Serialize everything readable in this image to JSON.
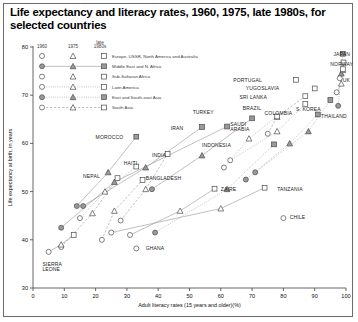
{
  "title": "Life expectancy and literacy rates, 1960, 1975, late 1980s, for selected countries",
  "legend": {
    "headers": [
      "1960",
      "1975",
      "late 1980s"
    ],
    "series": [
      {
        "label": "Europe, USSR, North America and Australia",
        "line": "none",
        "fill": "hollow"
      },
      {
        "label": "Middle East and N. Africa",
        "line": "solid",
        "fill": "filled"
      },
      {
        "label": "Sub-Saharan Africa",
        "line": "none",
        "fill": "hollow"
      },
      {
        "label": "Latin America",
        "line": "dotted",
        "fill": "hollow"
      },
      {
        "label": "East and South-east Asia",
        "line": "dotted",
        "fill": "filled"
      },
      {
        "label": "South Asia",
        "line": "dashed",
        "fill": "hollow"
      }
    ],
    "markers": {
      "1960": "circle",
      "1975": "triangle",
      "late1980s": "square"
    }
  },
  "chart_data": {
    "type": "scatter",
    "title": "Life expectancy and literacy rates, 1960, 1975, late 1980s, for selected countries",
    "xlabel": "Adult literacy rates (15 years and older)(%)",
    "ylabel": "Life expectancy at birth, in years",
    "xlim": [
      0,
      100
    ],
    "ylim": [
      30,
      80
    ],
    "xticks": [
      0,
      10,
      20,
      30,
      40,
      50,
      60,
      70,
      80,
      90,
      100
    ],
    "yticks": [
      30,
      40,
      50,
      60,
      70,
      80
    ],
    "grid": false,
    "legend_position": "top-left-inside",
    "point_years": [
      "1960",
      "1975",
      "late 1980s"
    ],
    "countries": [
      {
        "name": "JAPAN",
        "region": "East and South-east Asia",
        "label_x": 96,
        "label_y": 78.6,
        "points": [
          {
            "year": "1960",
            "x": 97.5,
            "y": 67.8
          },
          {
            "year": "1975",
            "x": 98.5,
            "y": 74.5
          },
          {
            "year": "late 1980s",
            "x": 99.0,
            "y": 78.6
          }
        ]
      },
      {
        "name": "NORWAY",
        "region": "Europe, USSR, North America and Australia",
        "label_x": 95,
        "label_y": 76.4,
        "points": [
          {
            "year": "1960",
            "x": 98.0,
            "y": 73.5
          },
          {
            "year": "1975",
            "x": 99.0,
            "y": 75.2
          },
          {
            "year": "late 1980s",
            "x": 99.2,
            "y": 76.8
          }
        ]
      },
      {
        "name": "UK",
        "region": "Europe, USSR, North America and Australia",
        "label_x": 99,
        "label_y": 73.2,
        "points": [
          {
            "year": "1960",
            "x": 97.0,
            "y": 70.6
          },
          {
            "year": "1975",
            "x": 98.5,
            "y": 72.4
          },
          {
            "year": "late 1980s",
            "x": 99.0,
            "y": 75.4
          }
        ]
      },
      {
        "name": "PORTUGAL",
        "region": "Europe, USSR, North America and Australia",
        "label_x": 64,
        "label_y": 73.2,
        "points": [
          {
            "year": "late 1980s",
            "x": 84.0,
            "y": 73.2
          }
        ]
      },
      {
        "name": "YUGOSLAVIA",
        "region": "Europe, USSR, North America and Australia",
        "label_x": 68,
        "label_y": 71.4,
        "points": [
          {
            "year": "late 1980s",
            "x": 90.0,
            "y": 71.4
          }
        ]
      },
      {
        "name": "SRI LANKA",
        "region": "South Asia",
        "label_x": 66,
        "label_y": 69.6,
        "points": [
          {
            "year": "1960",
            "x": 75.0,
            "y": 62.0
          },
          {
            "year": "1975",
            "x": 78.0,
            "y": 65.5
          },
          {
            "year": "late 1980s",
            "x": 87.0,
            "y": 69.8
          }
        ]
      },
      {
        "name": "S. KOREA",
        "region": "East and South-east Asia",
        "label_x": 84,
        "label_y": 67.0,
        "points": [
          {
            "year": "1960",
            "x": 71.0,
            "y": 54.0
          },
          {
            "year": "1975",
            "x": 88.0,
            "y": 62.5
          },
          {
            "year": "late 1980s",
            "x": 95.0,
            "y": 69.0
          }
        ]
      },
      {
        "name": "THAILAND",
        "region": "East and South-east Asia",
        "label_x": 92,
        "label_y": 65.6,
        "points": [
          {
            "year": "1960",
            "x": 68.0,
            "y": 52.5
          },
          {
            "year": "1975",
            "x": 82.0,
            "y": 60.0
          },
          {
            "year": "late 1980s",
            "x": 91.0,
            "y": 66.0
          }
        ]
      },
      {
        "name": "COLOMBIA",
        "region": "Latin America",
        "label_x": 74,
        "label_y": 66.2,
        "points": [
          {
            "year": "1960",
            "x": 63.0,
            "y": 56.5
          },
          {
            "year": "1975",
            "x": 78.0,
            "y": 62.5
          },
          {
            "year": "late 1980s",
            "x": 87.0,
            "y": 68.2
          }
        ]
      },
      {
        "name": "BRAZIL",
        "region": "Latin America",
        "label_x": 67,
        "label_y": 67.4,
        "points": [
          {
            "year": "1960",
            "x": 61.0,
            "y": 55.0
          },
          {
            "year": "1975",
            "x": 69.0,
            "y": 61.0
          },
          {
            "year": "late 1980s",
            "x": 78.0,
            "y": 65.6
          }
        ]
      },
      {
        "name": "TURKEY",
        "region": "Middle East and N. Africa",
        "label_x": 51,
        "label_y": 66.4,
        "points": [
          {
            "year": "1960",
            "x": 38.0,
            "y": 50.5
          },
          {
            "year": "1975",
            "x": 54.0,
            "y": 57.5
          },
          {
            "year": "late 1980s",
            "x": 70.0,
            "y": 65.2
          }
        ]
      },
      {
        "name": "SAUDI ARABIA",
        "region": "Middle East and N. Africa",
        "label_x": 63,
        "label_y": 63.6,
        "points": [
          {
            "year": "1960",
            "x": 9.0,
            "y": 42.5
          },
          {
            "year": "1975",
            "x": 26.0,
            "y": 52.0
          },
          {
            "year": "late 1980s",
            "x": 62.0,
            "y": 63.5
          }
        ]
      },
      {
        "name": "IRAN",
        "region": "Middle East and N. Africa",
        "label_x": 44,
        "label_y": 63.2,
        "points": [
          {
            "year": "1960",
            "x": 16.0,
            "y": 47.0
          },
          {
            "year": "1975",
            "x": 36.0,
            "y": 55.0
          },
          {
            "year": "late 1980s",
            "x": 54.0,
            "y": 63.4
          }
        ]
      },
      {
        "name": "INDONESIA",
        "region": "East and South-east Asia",
        "label_x": 54,
        "label_y": 59.6,
        "points": [
          {
            "year": "1960",
            "x": 39.0,
            "y": 41.5
          },
          {
            "year": "1975",
            "x": 62.0,
            "y": 50.5
          },
          {
            "year": "late 1980s",
            "x": 77.0,
            "y": 59.8
          }
        ]
      },
      {
        "name": "MOROCCO",
        "region": "Middle East and N. Africa",
        "label_x": 20,
        "label_y": 61.2,
        "points": [
          {
            "year": "1960",
            "x": 14.0,
            "y": 47.0
          },
          {
            "year": "1975",
            "x": 24.0,
            "y": 54.0
          },
          {
            "year": "late 1980s",
            "x": 33.0,
            "y": 61.4
          }
        ]
      },
      {
        "name": "INDIA",
        "region": "South Asia",
        "label_x": 38,
        "label_y": 57.6,
        "points": [
          {
            "year": "1960",
            "x": 28.0,
            "y": 44.0
          },
          {
            "year": "1975",
            "x": 36.0,
            "y": 50.5
          },
          {
            "year": "late 1980s",
            "x": 43.0,
            "y": 57.8
          }
        ]
      },
      {
        "name": "HAITI",
        "region": "Latin America",
        "label_x": 29,
        "label_y": 55.8,
        "points": [
          {
            "year": "1960",
            "x": 15.0,
            "y": 44.5
          },
          {
            "year": "1975",
            "x": 23.0,
            "y": 50.0
          },
          {
            "year": "late 1980s",
            "x": 33.0,
            "y": 55.2
          }
        ]
      },
      {
        "name": "BANGLADESH",
        "region": "South Asia",
        "label_x": 36,
        "label_y": 52.8,
        "points": [
          {
            "year": "1960",
            "x": 22.0,
            "y": 40.0
          },
          {
            "year": "1975",
            "x": 26.0,
            "y": 46.0
          },
          {
            "year": "late 1980s",
            "x": 35.0,
            "y": 52.4
          }
        ]
      },
      {
        "name": "NEPAL",
        "region": "South Asia",
        "label_x": 16,
        "label_y": 53.2,
        "points": [
          {
            "year": "1960",
            "x": 9.0,
            "y": 38.5
          },
          {
            "year": "1975",
            "x": 19.0,
            "y": 45.5
          },
          {
            "year": "late 1980s",
            "x": 27.0,
            "y": 52.8
          }
        ]
      },
      {
        "name": "ZAIRE",
        "region": "Sub-Saharan Africa",
        "label_x": 60,
        "label_y": 50.6,
        "points": [
          {
            "year": "1960",
            "x": 31.0,
            "y": 41.0
          },
          {
            "year": "1975",
            "x": 47.0,
            "y": 46.0
          },
          {
            "year": "late 1980s",
            "x": 58.0,
            "y": 50.6
          }
        ]
      },
      {
        "name": "TANZANIA",
        "region": "Sub-Saharan Africa",
        "label_x": 78,
        "label_y": 50.6,
        "points": [
          {
            "year": "1960",
            "x": 25.0,
            "y": 41.5
          },
          {
            "year": "1975",
            "x": 60.0,
            "y": 46.5
          },
          {
            "year": "late 1980s",
            "x": 74.0,
            "y": 50.8
          }
        ]
      },
      {
        "name": "CHILE",
        "region": "Latin America",
        "label_x": 82,
        "label_y": 44.6,
        "points": [
          {
            "year": "1960",
            "x": 80.0,
            "y": 44.5
          }
        ]
      },
      {
        "name": "GHANA",
        "region": "Sub-Saharan Africa",
        "label_x": 36,
        "label_y": 38.2,
        "points": [
          {
            "year": "1960",
            "x": 33.0,
            "y": 38.2
          }
        ]
      },
      {
        "name": "SIERRA LEONE",
        "region": "Sub-Saharan Africa",
        "label_x": 3,
        "label_y": 34.6,
        "points": [
          {
            "year": "1960",
            "x": 5.0,
            "y": 37.5
          },
          {
            "year": "1975",
            "x": 9.0,
            "y": 39.0
          },
          {
            "year": "late 1980s",
            "x": 13.0,
            "y": 41.0
          }
        ]
      }
    ]
  }
}
